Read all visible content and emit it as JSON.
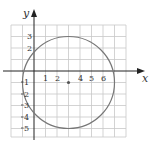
{
  "diagram": {
    "type": "circle-on-coordinate-plane",
    "x_axis_label": "x",
    "y_axis_label": "y",
    "x_tick_labels": [
      "1",
      "2",
      "4",
      "5",
      "6"
    ],
    "y_tick_labels": [
      "3",
      "2",
      "1",
      "2",
      "3",
      "4",
      "5"
    ],
    "circle": {
      "center": [
        3,
        -1
      ],
      "radius": 4,
      "color": "#777777"
    },
    "center_point": [
      3,
      -1
    ],
    "grid": {
      "xmin": -2,
      "xmax": 8,
      "ymin": -6,
      "ymax": 4
    }
  }
}
